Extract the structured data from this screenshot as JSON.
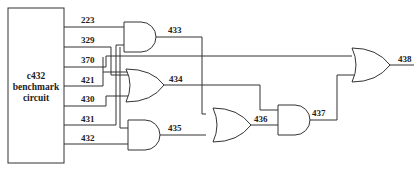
{
  "diagram": {
    "type": "logic circuit",
    "block": {
      "line1": "c432",
      "line2": "benchmark",
      "line3": "circuit"
    },
    "input_nets": [
      "223",
      "329",
      "370",
      "421",
      "430",
      "431",
      "432"
    ],
    "gates": [
      {
        "id": "433",
        "type": "AND",
        "inputs": [
          "223",
          "431"
        ]
      },
      {
        "id": "434",
        "type": "OR",
        "inputs": [
          "329",
          "421",
          "430"
        ]
      },
      {
        "id": "435",
        "type": "AND",
        "inputs": [
          "329",
          "432"
        ]
      },
      {
        "id": "436",
        "type": "OR",
        "inputs": [
          "433",
          "435"
        ]
      },
      {
        "id": "437",
        "type": "AND",
        "inputs": [
          "434",
          "436"
        ]
      },
      {
        "id": "438",
        "type": "OR",
        "inputs": [
          "370",
          "437"
        ]
      }
    ],
    "labels": {
      "n223": "223",
      "n329": "329",
      "n370": "370",
      "n421": "421",
      "n430": "430",
      "n431": "431",
      "n432": "432",
      "n433": "433",
      "n434": "434",
      "n435": "435",
      "n436": "436",
      "n437": "437",
      "n438": "438"
    }
  }
}
